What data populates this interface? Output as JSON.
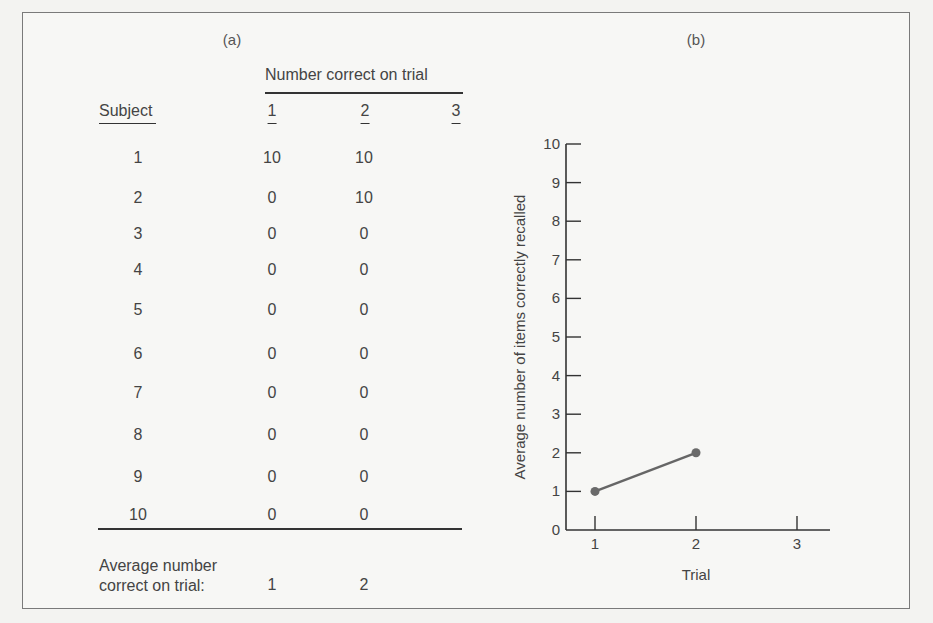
{
  "panels": {
    "a_label": "(a)",
    "b_label": "(b)"
  },
  "table": {
    "group_header": "Number correct on trial",
    "subject_header": "Subject",
    "trial_headers": [
      "1",
      "2",
      "3"
    ],
    "rows": [
      {
        "subject": "1",
        "t1": "10",
        "t2": "10",
        "t3": ""
      },
      {
        "subject": "2",
        "t1": "0",
        "t2": "10",
        "t3": ""
      },
      {
        "subject": "3",
        "t1": "0",
        "t2": "0",
        "t3": ""
      },
      {
        "subject": "4",
        "t1": "0",
        "t2": "0",
        "t3": ""
      },
      {
        "subject": "5",
        "t1": "0",
        "t2": "0",
        "t3": ""
      },
      {
        "subject": "6",
        "t1": "0",
        "t2": "0",
        "t3": ""
      },
      {
        "subject": "7",
        "t1": "0",
        "t2": "0",
        "t3": ""
      },
      {
        "subject": "8",
        "t1": "0",
        "t2": "0",
        "t3": ""
      },
      {
        "subject": "9",
        "t1": "0",
        "t2": "0",
        "t3": ""
      },
      {
        "subject": "10",
        "t1": "0",
        "t2": "0",
        "t3": ""
      }
    ],
    "average_label_line1": "Average number",
    "average_label_line2": "correct on trial:",
    "averages": [
      "1",
      "2",
      ""
    ]
  },
  "colors": {
    "line": "#666666",
    "marker": "#6a6a6a",
    "axis": "#333333"
  },
  "chart_data": [
    {
      "type": "table",
      "title": "(a) Number correct on trial",
      "columns": [
        "Subject",
        "1",
        "2",
        "3"
      ],
      "rows": [
        [
          "1",
          10,
          10,
          null
        ],
        [
          "2",
          0,
          10,
          null
        ],
        [
          "3",
          0,
          0,
          null
        ],
        [
          "4",
          0,
          0,
          null
        ],
        [
          "5",
          0,
          0,
          null
        ],
        [
          "6",
          0,
          0,
          null
        ],
        [
          "7",
          0,
          0,
          null
        ],
        [
          "8",
          0,
          0,
          null
        ],
        [
          "9",
          0,
          0,
          null
        ],
        [
          "10",
          0,
          0,
          null
        ]
      ],
      "footer": [
        "Average number correct on trial:",
        1,
        2,
        null
      ]
    },
    {
      "type": "line",
      "title": "(b)",
      "xlabel": "Trial",
      "ylabel": "Average number of items correctly recalled",
      "x": [
        1,
        2
      ],
      "series": [
        {
          "name": "Average correct",
          "values": [
            1,
            2
          ]
        }
      ],
      "x_ticks": [
        "1",
        "2",
        "3"
      ],
      "y_ticks": [
        "0",
        "1",
        "2",
        "3",
        "4",
        "5",
        "6",
        "7",
        "8",
        "9",
        "10"
      ],
      "xlim": [
        0.7,
        3.3
      ],
      "ylim": [
        0,
        10
      ],
      "grid": false,
      "legend": "none"
    }
  ]
}
